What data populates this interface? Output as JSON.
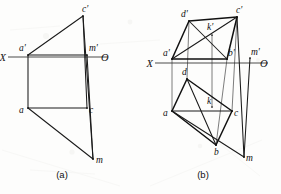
{
  "figure": {
    "kind": "descriptive-geometry-orthographic-projection",
    "panels": [
      {
        "id": "a",
        "caption": "(a)",
        "caption_x": 62,
        "caption_y": 178,
        "axis": {
          "left_label": "X",
          "right_label": "O",
          "y": 57,
          "x_start": 8,
          "x_end": 108,
          "left_label_x": 6,
          "left_label_y": 61,
          "right_label_x": 101,
          "right_label_y": 61
        },
        "points": [
          {
            "name": "a'",
            "x": 28,
            "y": 55,
            "label_x": 19,
            "label_y": 51
          },
          {
            "name": "c'",
            "x": 83,
            "y": 16,
            "label_x": 82,
            "label_y": 12
          },
          {
            "name": "m'",
            "x": 87,
            "y": 55,
            "label_x": 89,
            "label_y": 51
          },
          {
            "name": "a",
            "x": 28,
            "y": 108,
            "label_x": 19,
            "label_y": 113
          },
          {
            "name": "c",
            "x": 87,
            "y": 108,
            "label_x": 89,
            "label_y": 113
          },
          {
            "name": "m",
            "x": 93,
            "y": 159,
            "label_x": 96,
            "label_y": 163
          }
        ],
        "edges": [
          {
            "from": "a'",
            "to": "c'",
            "weight": "med"
          },
          {
            "from": "c'",
            "to": "m",
            "weight": "med"
          },
          {
            "from": "a'",
            "to": "m'",
            "weight": "med"
          },
          {
            "from": "a'",
            "to": "a",
            "weight": "med"
          },
          {
            "from": "a",
            "to": "c",
            "weight": "med"
          },
          {
            "from": "c",
            "to": "c'",
            "weight": "med"
          },
          {
            "from": "a",
            "to": "m",
            "weight": "med"
          },
          {
            "from": "m'",
            "to": "m",
            "weight": "med"
          }
        ]
      },
      {
        "id": "b",
        "caption": "(b)",
        "caption_x": 203,
        "caption_y": 178,
        "axis": {
          "left_label": "X",
          "right_label": "O",
          "y": 63,
          "x_start": 155,
          "x_end": 268,
          "left_label_x": 153,
          "left_label_y": 67,
          "right_label_x": 260,
          "right_label_y": 67
        },
        "points": [
          {
            "name": "d'",
            "x": 189,
            "y": 21,
            "label_x": 181,
            "label_y": 17
          },
          {
            "name": "c'",
            "x": 237,
            "y": 17,
            "label_x": 236,
            "label_y": 13
          },
          {
            "name": "k'",
            "x": 212,
            "y": 35,
            "label_x": 207,
            "label_y": 30
          },
          {
            "name": "a'",
            "x": 172,
            "y": 59,
            "label_x": 163,
            "label_y": 56
          },
          {
            "name": "b'",
            "x": 227,
            "y": 59,
            "label_x": 228,
            "label_y": 56
          },
          {
            "name": "m'",
            "x": 250,
            "y": 58,
            "label_x": 251,
            "label_y": 55
          },
          {
            "name": "d",
            "x": 187,
            "y": 79,
            "label_x": 182,
            "label_y": 75
          },
          {
            "name": "a",
            "x": 172,
            "y": 111,
            "label_x": 163,
            "label_y": 116
          },
          {
            "name": "k",
            "x": 212,
            "y": 107,
            "label_x": 207,
            "label_y": 104
          },
          {
            "name": "c",
            "x": 232,
            "y": 111,
            "label_x": 234,
            "label_y": 116
          },
          {
            "name": "b",
            "x": 216,
            "y": 145,
            "label_x": 214,
            "label_y": 155
          },
          {
            "name": "m",
            "x": 244,
            "y": 157,
            "label_x": 246,
            "label_y": 161
          }
        ],
        "edges": [
          {
            "from": "a'",
            "to": "d'",
            "weight": "heavy"
          },
          {
            "from": "d'",
            "to": "c'",
            "weight": "heavy"
          },
          {
            "from": "c'",
            "to": "b'",
            "weight": "heavy"
          },
          {
            "from": "b'",
            "to": "a'",
            "weight": "heavy"
          },
          {
            "from": "a'",
            "to": "c'",
            "weight": "med"
          },
          {
            "from": "d'",
            "to": "b'",
            "weight": "med"
          },
          {
            "from": "a",
            "to": "d",
            "weight": "heavy"
          },
          {
            "from": "d",
            "to": "c",
            "weight": "heavy"
          },
          {
            "from": "c",
            "to": "b",
            "weight": "heavy"
          },
          {
            "from": "b",
            "to": "a",
            "weight": "heavy"
          },
          {
            "from": "a",
            "to": "c",
            "weight": "med"
          },
          {
            "from": "d",
            "to": "b",
            "weight": "med"
          },
          {
            "from": "c'",
            "to": "m",
            "weight": "med"
          },
          {
            "from": "a",
            "to": "m",
            "weight": "med"
          },
          {
            "from": "m'",
            "to": "m",
            "weight": "med"
          }
        ],
        "projectors": [
          {
            "from": "a'",
            "to": "a"
          },
          {
            "from": "b'",
            "to": "b"
          },
          {
            "from": "c'",
            "to": "c"
          },
          {
            "from": "d'",
            "to": "d"
          },
          {
            "from": "k'",
            "to": "k"
          }
        ]
      }
    ]
  }
}
